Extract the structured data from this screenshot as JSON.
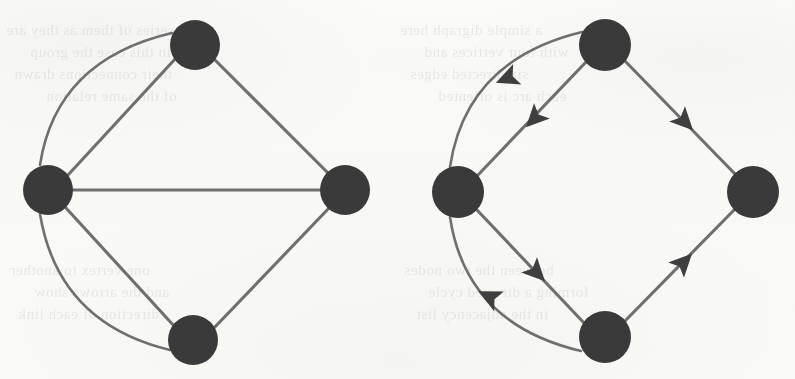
{
  "figure": {
    "kind": "graph-diagram-pair",
    "background_color": "#fbfbf9",
    "node_color": "#3a3a3a",
    "edge_color": "#6f6f6f",
    "arrow_color": "#3f3f3f",
    "node_radius": 25,
    "edge_width": 3.1
  },
  "ghost_text": [
    {
      "text": "a series of them as they are",
      "x": 6,
      "y": 22
    },
    {
      "text": "in this case the group",
      "x": 30,
      "y": 44
    },
    {
      "text": "their connections drawn",
      "x": 14,
      "y": 66
    },
    {
      "text": "of the same relation",
      "x": 46,
      "y": 88
    },
    {
      "text": "one vertex to another",
      "x": 10,
      "y": 262
    },
    {
      "text": "and the arrows show",
      "x": 34,
      "y": 284
    },
    {
      "text": "direction of each link",
      "x": 18,
      "y": 306
    },
    {
      "text": "a simple digraph here",
      "x": 400,
      "y": 22
    },
    {
      "text": "with four vertices and",
      "x": 424,
      "y": 44
    },
    {
      "text": "six directed edges",
      "x": 410,
      "y": 66
    },
    {
      "text": "each arc is oriented",
      "x": 438,
      "y": 88
    },
    {
      "text": "between the two nodes",
      "x": 404,
      "y": 262
    },
    {
      "text": "forming a directed cycle",
      "x": 428,
      "y": 284
    },
    {
      "text": "in the adjacency list",
      "x": 416,
      "y": 306
    }
  ],
  "left_graph": {
    "name": "undirected-multigraph",
    "directed": false,
    "nodes": [
      {
        "id": "top",
        "label": "top-vertex",
        "cx": 195,
        "cy": 45,
        "r": 25
      },
      {
        "id": "left",
        "label": "left-vertex",
        "cx": 48,
        "cy": 190,
        "r": 25
      },
      {
        "id": "right",
        "label": "right-vertex",
        "cx": 345,
        "cy": 190,
        "r": 25
      },
      {
        "id": "bottom",
        "label": "bottom-vertex",
        "cx": 193,
        "cy": 340,
        "r": 25
      }
    ],
    "edges": [
      {
        "id": "left-top-straight",
        "from": "left",
        "to": "top",
        "shape": "straight",
        "path": "M 68 175 L 176 58"
      },
      {
        "id": "left-top-arc",
        "from": "left",
        "to": "top",
        "shape": "curved",
        "path": "M 40 165 Q 56 60 172 33"
      },
      {
        "id": "top-right",
        "from": "top",
        "to": "right",
        "shape": "straight",
        "path": "M 215 60 L 329 174"
      },
      {
        "id": "left-right-straight",
        "from": "left",
        "to": "right",
        "shape": "straight",
        "path": "M 73 190 L 320 190"
      },
      {
        "id": "left-bottom-straight",
        "from": "left",
        "to": "bottom",
        "shape": "straight",
        "path": "M 66 208 L 175 327"
      },
      {
        "id": "left-bottom-arc",
        "from": "left",
        "to": "bottom",
        "shape": "curved",
        "path": "M 40 214 Q 58 323 170 350"
      },
      {
        "id": "bottom-right",
        "from": "bottom",
        "to": "right",
        "shape": "straight",
        "path": "M 213 329 L 330 207"
      }
    ]
  },
  "right_graph": {
    "name": "directed-multigraph",
    "directed": true,
    "nodes": [
      {
        "id": "top",
        "label": "top-vertex",
        "cx": 605,
        "cy": 45,
        "r": 26
      },
      {
        "id": "left",
        "label": "left-vertex",
        "cx": 458,
        "cy": 192,
        "r": 26
      },
      {
        "id": "right",
        "label": "right-vertex",
        "cx": 753,
        "cy": 192,
        "r": 26
      },
      {
        "id": "bottom",
        "label": "bottom-vertex",
        "cx": 605,
        "cy": 337,
        "r": 26
      }
    ],
    "edges": [
      {
        "id": "top-left-straight",
        "from": "top",
        "to": "left",
        "shape": "straight",
        "path": "M 586 62 L 478 175",
        "arrow": {
          "x": 535,
          "y": 118,
          "angle": 134
        }
      },
      {
        "id": "top-left-arc",
        "from": "top",
        "to": "left",
        "shape": "curved",
        "path": "M 582 32 Q 466 60 450 167",
        "arrow": {
          "x": 508,
          "y": 78,
          "angle": 158
        }
      },
      {
        "id": "top-right",
        "from": "top",
        "to": "right",
        "shape": "straight",
        "path": "M 625 61 L 736 175",
        "arrow": {
          "x": 684,
          "y": 121,
          "angle": 46
        }
      },
      {
        "id": "left-bottom",
        "from": "left",
        "to": "bottom",
        "shape": "straight",
        "path": "M 477 210 L 585 324",
        "arrow": {
          "x": 536,
          "y": 272,
          "angle": 46
        }
      },
      {
        "id": "bottom-left-arc",
        "from": "bottom",
        "to": "left",
        "shape": "curved",
        "path": "M 581 351 Q 466 324 450 217",
        "arrow": {
          "x": 490,
          "y": 297,
          "angle": 206
        }
      },
      {
        "id": "bottom-right",
        "from": "bottom",
        "to": "right",
        "shape": "straight",
        "path": "M 624 322 L 735 209",
        "arrow": {
          "x": 683,
          "y": 263,
          "angle": -46
        }
      }
    ]
  }
}
